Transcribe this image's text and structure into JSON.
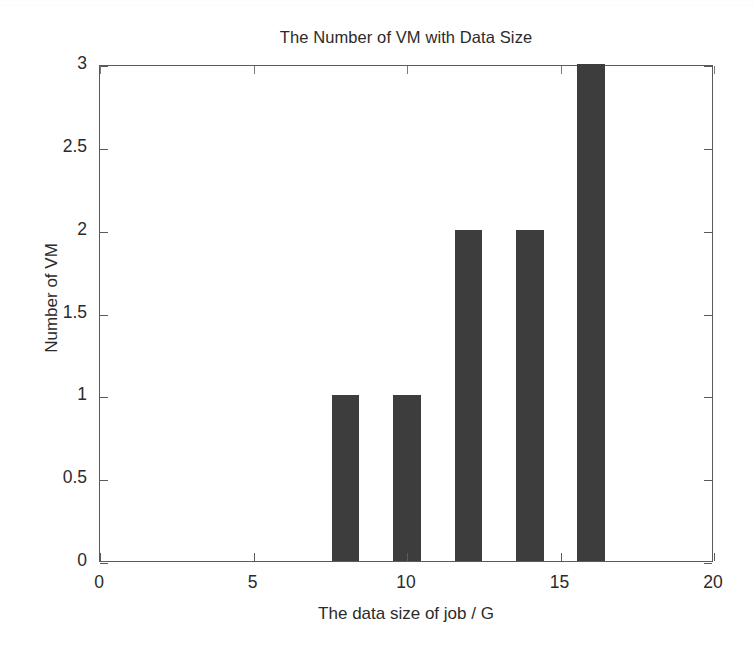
{
  "chart_data": {
    "type": "bar",
    "title": "The Number of VM with Data Size",
    "xlabel": "The data size of job / G",
    "ylabel": "Number of VM",
    "x": [
      8,
      10,
      12,
      14,
      16
    ],
    "values": [
      1,
      1,
      2,
      2,
      3
    ],
    "categories": [
      "8",
      "10",
      "12",
      "14",
      "16"
    ],
    "bar_width": 0.9,
    "xlim": [
      0,
      20
    ],
    "ylim": [
      0,
      3
    ],
    "xticks": [
      0,
      5,
      10,
      15,
      20
    ],
    "xtick_labels": [
      "0",
      "5",
      "10",
      "15",
      "20"
    ],
    "yticks": [
      0,
      0.5,
      1,
      1.5,
      2,
      2.5,
      3
    ],
    "ytick_labels": [
      "0",
      "0.5",
      "1",
      "1.5",
      "2",
      "2.5",
      "3"
    ],
    "grid": false,
    "legend": null,
    "legend_position": "none",
    "bar_color": "#3d3d3d",
    "axis_color": "#5a5a5a",
    "background": "#ffffff",
    "points": [
      {
        "x": 8,
        "y": 1
      },
      {
        "x": 10,
        "y": 1
      },
      {
        "x": 12,
        "y": 2
      },
      {
        "x": 14,
        "y": 2
      },
      {
        "x": 16,
        "y": 3
      }
    ]
  }
}
